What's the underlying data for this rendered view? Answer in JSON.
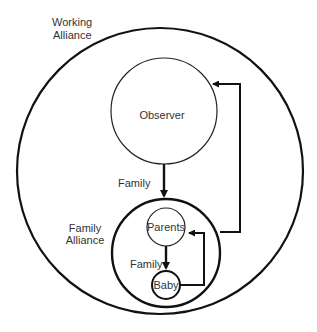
{
  "diagram": {
    "labels": {
      "working_alliance_line1": "Working",
      "working_alliance_line2": "Alliance",
      "observer": "Observer",
      "family_arrow_outer": "Family",
      "family_alliance_line1": "Family",
      "family_alliance_line2": "Alliance",
      "parents": "Parents",
      "family_arrow_inner": "Family",
      "baby": "Baby"
    },
    "nodes": [
      {
        "id": "working-alliance",
        "type": "circle",
        "label": "Working Alliance"
      },
      {
        "id": "observer",
        "type": "circle",
        "label": "Observer"
      },
      {
        "id": "family-alliance",
        "type": "circle",
        "label": "Family Alliance"
      },
      {
        "id": "parents",
        "type": "circle",
        "label": "Parents"
      },
      {
        "id": "baby",
        "type": "circle",
        "label": "Baby"
      }
    ],
    "edges": [
      {
        "from": "observer",
        "to": "family-alliance",
        "label": "Family"
      },
      {
        "from": "family-alliance",
        "to": "observer",
        "label": ""
      },
      {
        "from": "parents",
        "to": "baby",
        "label": "Family"
      },
      {
        "from": "baby",
        "to": "parents",
        "label": ""
      }
    ],
    "colors": {
      "stroke": "#111111",
      "text": "#333333",
      "background": "#ffffff"
    }
  }
}
